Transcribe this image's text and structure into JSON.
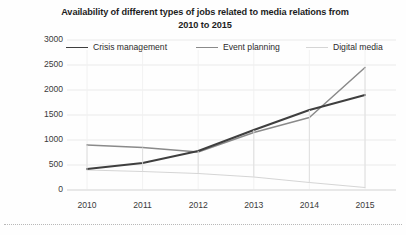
{
  "chart_data": {
    "type": "line",
    "title": "Availability of different types of jobs related to media relations from 2010 to 2015",
    "title_line1": "Availability of different types of jobs related to media relations from",
    "title_line2": "2010 to 2015",
    "xlabel": "",
    "ylabel": "",
    "categories": [
      "2010",
      "2011",
      "2012",
      "2013",
      "2014",
      "2015"
    ],
    "x": [
      2010,
      2011,
      2012,
      2013,
      2014,
      2015
    ],
    "ylim": [
      0,
      3000
    ],
    "yticks": [
      "0",
      "500",
      "1000",
      "1500",
      "2000",
      "2500",
      "3000"
    ],
    "ytick_values": [
      0,
      500,
      1000,
      1500,
      2000,
      2500,
      3000
    ],
    "grid": true,
    "legend_position": "top",
    "series": [
      {
        "name": "Crisis management",
        "color": "#3f3f3f",
        "values": [
          420,
          540,
          780,
          1200,
          1600,
          1900
        ]
      },
      {
        "name": "Event planning",
        "color": "#8a8a8a",
        "values": [
          900,
          850,
          760,
          1150,
          1450,
          2450
        ]
      },
      {
        "name": "Digital media",
        "color": "#d5d5d5",
        "values": [
          400,
          370,
          330,
          260,
          150,
          50
        ]
      }
    ]
  },
  "legend": {
    "items": [
      {
        "label": "Crisis management",
        "color": "#3f3f3f"
      },
      {
        "label": "Event planning",
        "color": "#8a8a8a"
      },
      {
        "label": "Digital media",
        "color": "#d5d5d5"
      }
    ]
  }
}
